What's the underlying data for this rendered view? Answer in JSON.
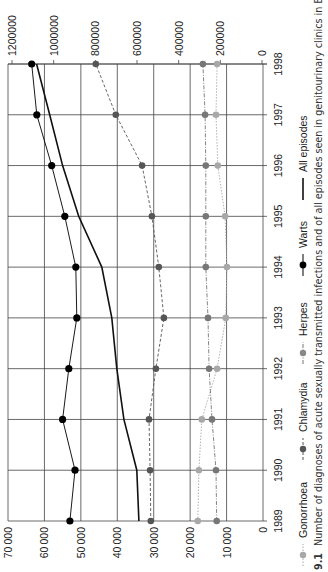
{
  "chart_data": {
    "type": "line",
    "orientation": "rotated 90 degrees clockwise",
    "caption_number": "9.1",
    "title": "Number of diagnoses of acute sexually transmitted infections and of all episodes seen in genitourinary clinics in England",
    "xlabel": "",
    "x": [
      "1989",
      "1990",
      "1991",
      "1992",
      "1993",
      "1994",
      "1995",
      "1996",
      "1997",
      "1998"
    ],
    "left_axis": {
      "ticks": [
        "70000",
        "60000",
        "50000",
        "40000",
        "30000",
        "20000",
        "10000",
        "0"
      ],
      "ylim": [
        0,
        70000
      ]
    },
    "right_axis": {
      "ticks": [
        "1200000",
        "1000000",
        "800000",
        "600000",
        "400000",
        "200000",
        "0"
      ],
      "ylim": [
        0,
        1200000
      ]
    },
    "grid": true,
    "legend_position": "bottom",
    "series": [
      {
        "name": "Gonorrhoea",
        "axis": "left",
        "style": "dotted",
        "marker": true,
        "color": "#a8a8a8",
        "values": [
          17900,
          17600,
          16800,
          12600,
          10200,
          9900,
          10400,
          12400,
          12900,
          12600
        ]
      },
      {
        "name": "Chlamydia",
        "axis": "left",
        "style": "dashed",
        "marker": true,
        "color": "#555555",
        "values": [
          30800,
          31000,
          31300,
          29400,
          27200,
          28600,
          30500,
          33200,
          40400,
          45900
        ]
      },
      {
        "name": "Herpes",
        "axis": "left",
        "style": "dash-dot",
        "marker": true,
        "color": "#777777",
        "values": [
          12700,
          12900,
          14000,
          14800,
          15100,
          15700,
          15700,
          15700,
          15900,
          16500
        ]
      },
      {
        "name": "Warts",
        "axis": "left",
        "style": "solid",
        "marker": true,
        "color": "#000000",
        "values": [
          53000,
          51600,
          55000,
          53300,
          51100,
          51400,
          54400,
          58000,
          62100,
          63500
        ]
      },
      {
        "name": "All episodes",
        "axis": "right",
        "style": "solid-thick",
        "marker": false,
        "color": "#111111",
        "values": [
          591000,
          601000,
          663000,
          697000,
          721000,
          769000,
          880000,
          957000,
          1019000,
          1082000
        ]
      }
    ]
  },
  "legend": {
    "items": [
      {
        "label": "Gonorrhoea"
      },
      {
        "label": "Chlamydia"
      },
      {
        "label": "Herpes"
      },
      {
        "label": "Warts"
      },
      {
        "label": "All episodes"
      }
    ]
  },
  "caption": {
    "number": "9.1",
    "text": "Number of diagnoses of acute sexually transmitted infections and of all episodes seen in genitourinary clinics in England"
  }
}
